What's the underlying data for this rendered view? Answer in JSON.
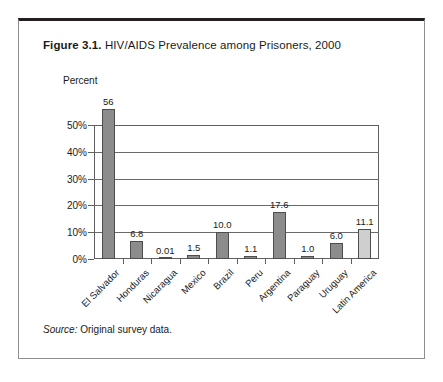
{
  "figure": {
    "number_label": "Figure 3.1.",
    "title": "HIV/AIDS Prevalence among Prisoners, 2000",
    "source_lead": "Source:",
    "source_text": "Original survey data."
  },
  "chart_data": {
    "type": "bar",
    "title": "HIV/AIDS Prevalence among Prisoners, 2000",
    "xlabel": "",
    "ylabel": "Percent",
    "ylim": [
      0,
      56
    ],
    "axis_max_gridline": 50,
    "ytick_labels": [
      "0%",
      "10%",
      "20%",
      "30%",
      "40%",
      "50%"
    ],
    "ytick_values": [
      0,
      10,
      20,
      30,
      40,
      50
    ],
    "grid": true,
    "legend": false,
    "categories": [
      "El Salvador",
      "Honduras",
      "Nicaragua",
      "Mexico",
      "Brazil",
      "Peru",
      "Argentina",
      "Paraguay",
      "Uruguay",
      "Latin America"
    ],
    "values": [
      56,
      6.8,
      0.01,
      1.5,
      10.0,
      1.1,
      17.6,
      1.0,
      6.0,
      11.1
    ],
    "value_labels": [
      "56",
      "6.8",
      "0.01",
      "1.5",
      "10.0",
      "1.1",
      "17.6",
      "1.0",
      "6.0",
      "11.1"
    ],
    "highlight_index": 9,
    "colors": {
      "bar": "#8c8c8c",
      "bar_highlight": "#cfcfcf",
      "bar_outline": "#4d4d4d",
      "axis": "#5f5f5f",
      "text": "#1a1a1a",
      "frame_top": "#231f20"
    }
  }
}
